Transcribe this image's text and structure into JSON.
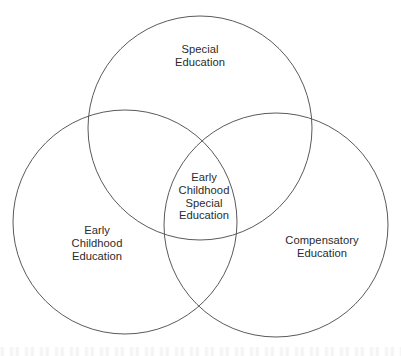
{
  "diagram": {
    "type": "venn",
    "set_count": 3,
    "canvas": {
      "width": 401,
      "height": 356
    },
    "style": {
      "background_color": "#ffffff",
      "stroke_color": "#5a5a5a",
      "stroke_width": 1,
      "text_color": "#2b2b2b",
      "fill": "none"
    },
    "circles": [
      {
        "id": "special-education",
        "cx": 200,
        "cy": 128,
        "r": 112
      },
      {
        "id": "early-childhood",
        "cx": 125,
        "cy": 222,
        "r": 112
      },
      {
        "id": "compensatory-education",
        "cx": 276,
        "cy": 225,
        "r": 112
      }
    ],
    "labels": {
      "top": {
        "text": "Special\nEducation",
        "x": 200,
        "y": 56
      },
      "left": {
        "text": "Early\nChildhood\nEducation",
        "x": 97,
        "y": 243
      },
      "right": {
        "text": "Compensatory\nEducation",
        "x": 322,
        "y": 247
      },
      "center": {
        "text": "Early\nChildhood\nSpecial\nEducation",
        "x": 204,
        "y": 197
      }
    }
  }
}
